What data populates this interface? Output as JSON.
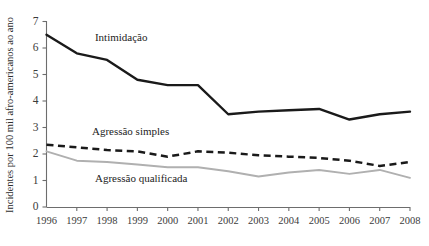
{
  "chart_data": {
    "type": "line",
    "title": "",
    "xlabel": "",
    "ylabel": "Incidentes por 100 mil afro-americanos ao ano",
    "ylim": [
      0,
      7
    ],
    "yticks": [
      0,
      1,
      2,
      3,
      4,
      5,
      6,
      7
    ],
    "ytick_labels": [
      "0",
      "1",
      "2",
      "3",
      "4",
      "5",
      "6",
      "7"
    ],
    "grid": false,
    "legend_position": "inline-annotations",
    "categories": [
      1996,
      1997,
      1998,
      1999,
      2000,
      2001,
      2002,
      2003,
      2004,
      2005,
      2006,
      2007,
      2008
    ],
    "xtick_labels": [
      "1996",
      "1997",
      "1998",
      "1999",
      "2000",
      "2001",
      "2002",
      "2003",
      "2004",
      "2005",
      "2006",
      "2007",
      "2008"
    ],
    "series": [
      {
        "name": "Intimidação",
        "style": "solid",
        "color": "#1a1a1a",
        "values": [
          6.5,
          5.8,
          5.55,
          4.8,
          4.6,
          4.6,
          3.5,
          3.6,
          3.65,
          3.7,
          3.3,
          3.5,
          3.6
        ],
        "label_x": 1997.6,
        "label_y": 6.25
      },
      {
        "name": "Agressão simples",
        "style": "dashed",
        "color": "#1a1a1a",
        "values": [
          2.35,
          2.25,
          2.15,
          2.1,
          1.9,
          2.1,
          2.05,
          1.95,
          1.9,
          1.85,
          1.75,
          1.55,
          1.7
        ],
        "label_x": 1997.5,
        "label_y": 2.72
      },
      {
        "name": "Agressão qualificada",
        "style": "solid-gray",
        "color": "#b0b0b0",
        "values": [
          2.1,
          1.75,
          1.7,
          1.6,
          1.5,
          1.5,
          1.35,
          1.15,
          1.3,
          1.4,
          1.25,
          1.4,
          1.1
        ],
        "label_x": 1997.6,
        "label_y": 0.95
      }
    ]
  }
}
